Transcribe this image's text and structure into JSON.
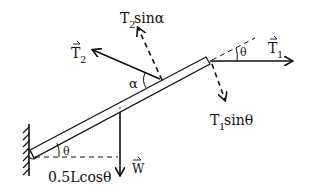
{
  "diagram": {
    "labels": {
      "t2": "T",
      "t2_sub": "2",
      "t2_sin": "T",
      "t2_sin_sub": "2",
      "t2_sin_rest": " sinα",
      "t1": "T",
      "t1_sub": "1",
      "t1_sin": "T",
      "t1_sin_sub": "1",
      "t1_sin_rest": " sinθ",
      "alpha": "α",
      "theta_top": "θ",
      "theta_bottom": "θ",
      "weight": "W",
      "moment_arm": "0.5Lcosθ"
    },
    "colors": {
      "ink": "#111111",
      "background": "#ffffff"
    }
  }
}
